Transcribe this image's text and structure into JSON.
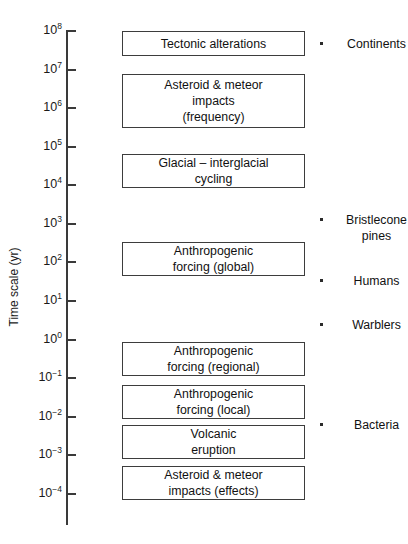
{
  "figure": {
    "background_color": "#ffffff",
    "line_color": "#3a3a3a",
    "text_color": "#111111"
  },
  "axis": {
    "title": "Time scale (yr)",
    "orientation": "vertical",
    "scale": "log10",
    "ticks": [
      {
        "base": "10",
        "exponent": "8",
        "value": 100000000,
        "y": 31
      },
      {
        "base": "10",
        "exponent": "7",
        "value": 10000000,
        "y": 70
      },
      {
        "base": "10",
        "exponent": "6",
        "value": 1000000,
        "y": 108
      },
      {
        "base": "10",
        "exponent": "5",
        "value": 100000,
        "y": 147
      },
      {
        "base": "10",
        "exponent": "4",
        "value": 10000,
        "y": 185
      },
      {
        "base": "10",
        "exponent": "3",
        "value": 1000,
        "y": 224
      },
      {
        "base": "10",
        "exponent": "2",
        "value": 100,
        "y": 262
      },
      {
        "base": "10",
        "exponent": "1",
        "value": 10,
        "y": 301
      },
      {
        "base": "10",
        "exponent": "0",
        "value": 1,
        "y": 340
      },
      {
        "base": "10",
        "exponent": "−1",
        "value": 0.1,
        "y": 378
      },
      {
        "base": "10",
        "exponent": "−2",
        "value": 0.01,
        "y": 417
      },
      {
        "base": "10",
        "exponent": "−3",
        "value": 0.001,
        "y": 455
      },
      {
        "base": "10",
        "exponent": "−4",
        "value": 0.0001,
        "y": 494
      }
    ]
  },
  "chart_data": {
    "type": "bar",
    "title": "",
    "xlabel": "",
    "ylabel": "Time scale (yr)",
    "ylim": [
      0.0001,
      100000000
    ],
    "yscale": "log",
    "grid": false,
    "legend": false,
    "orientation": "horizontal-range-bars",
    "categories": [
      "Tectonic alterations",
      "Asteroid & meteor impacts (frequency)",
      "Glacial – interglacial cycling",
      "Anthropogenic forcing (global)",
      "Anthropogenic forcing (regional)",
      "Anthropogenic forcing (local)",
      "Volcanic eruption",
      "Asteroid & meteor impacts (effects)"
    ],
    "ranges_years": [
      {
        "label": "Tectonic alterations",
        "y_min": 10000000.0,
        "y_max": 100000000.0
      },
      {
        "label": "Asteroid & meteor impacts (frequency)",
        "y_min": 100000.0,
        "y_max": 10000000.0
      },
      {
        "label": "Glacial – interglacial cycling",
        "y_min": 10000.0,
        "y_max": 100000.0
      },
      {
        "label": "Anthropogenic forcing (global)",
        "y_min": 10,
        "y_max": 1000
      },
      {
        "label": "Anthropogenic forcing (regional)",
        "y_min": 0.1,
        "y_max": 1
      },
      {
        "label": "Anthropogenic forcing (local)",
        "y_min": 0.01,
        "y_max": 0.1
      },
      {
        "label": "Volcanic eruption",
        "y_min": 0.001,
        "y_max": 0.01
      },
      {
        "label": "Asteroid & meteor impacts (effects)",
        "y_min": 0.0001,
        "y_max": 0.001
      }
    ],
    "annotations": [
      {
        "label": "Continents",
        "y_value": 100000000.0
      },
      {
        "label": "Bristlecone pines",
        "y_value": 1000
      },
      {
        "label": "Humans",
        "y_value": 100
      },
      {
        "label": "Warblers",
        "y_value": 10
      },
      {
        "label": "Bacteria",
        "y_value": 0.01
      }
    ]
  },
  "boxes": [
    {
      "name": "tectonic-alterations",
      "lines": [
        "Tectonic alterations"
      ],
      "top": 31,
      "height": 25
    },
    {
      "name": "asteroid-meteor-impacts-frequency",
      "lines": [
        "Asteroid & meteor",
        "impacts",
        "(frequency)"
      ],
      "top": 74,
      "height": 54
    },
    {
      "name": "glacial-interglacial-cycling",
      "lines": [
        "Glacial – interglacial",
        "cycling"
      ],
      "top": 154,
      "height": 34
    },
    {
      "name": "anthropogenic-forcing-global",
      "lines": [
        "Anthropogenic",
        "forcing (global)"
      ],
      "top": 242,
      "height": 34
    },
    {
      "name": "anthropogenic-forcing-regional",
      "lines": [
        "Anthropogenic",
        "forcing (regional)"
      ],
      "top": 342,
      "height": 34
    },
    {
      "name": "anthropogenic-forcing-local",
      "lines": [
        "Anthropogenic",
        "forcing (local)"
      ],
      "top": 385,
      "height": 34
    },
    {
      "name": "volcanic-eruption",
      "lines": [
        "Volcanic",
        "eruption"
      ],
      "top": 425,
      "height": 34
    },
    {
      "name": "asteroid-meteor-impacts-effects",
      "lines": [
        "Asteroid & meteor",
        "impacts (effects)"
      ],
      "top": 466,
      "height": 34
    }
  ],
  "references": [
    {
      "name": "continents",
      "lines": [
        "Continents"
      ],
      "top": 36
    },
    {
      "name": "bristlecone-pines",
      "lines": [
        "Bristlecone",
        "pines"
      ],
      "top": 212
    },
    {
      "name": "humans",
      "lines": [
        "Humans"
      ],
      "top": 273
    },
    {
      "name": "warblers",
      "lines": [
        "Warblers"
      ],
      "top": 317
    },
    {
      "name": "bacteria",
      "lines": [
        "Bacteria"
      ],
      "top": 417
    }
  ]
}
